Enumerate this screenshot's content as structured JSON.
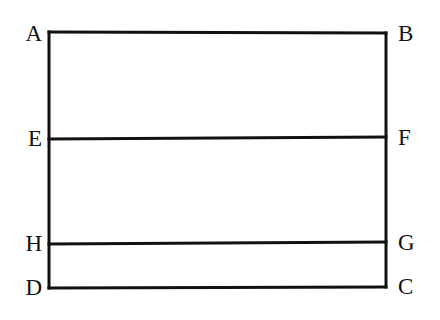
{
  "figure": {
    "background_color": "#ffffff",
    "stroke_color": "#111111",
    "stroke_width": 3,
    "canvas": {
      "width": 440,
      "height": 320
    },
    "labels": {
      "a": "A",
      "b": "B",
      "c": "C",
      "d": "D",
      "e": "E",
      "f": "F",
      "g": "G",
      "h": "H"
    },
    "points": {
      "A": {
        "x": 49,
        "y": 32
      },
      "B": {
        "x": 386,
        "y": 33
      },
      "C": {
        "x": 386,
        "y": 287
      },
      "D": {
        "x": 49,
        "y": 288
      },
      "E": {
        "x": 49,
        "y": 139
      },
      "F": {
        "x": 386,
        "y": 137
      },
      "G": {
        "x": 386,
        "y": 242
      },
      "H": {
        "x": 49,
        "y": 244
      }
    },
    "segments": [
      {
        "name": "AB",
        "from": "A",
        "to": "B"
      },
      {
        "name": "BC",
        "from": "B",
        "to": "C"
      },
      {
        "name": "CD",
        "from": "C",
        "to": "D"
      },
      {
        "name": "DA",
        "from": "D",
        "to": "A"
      },
      {
        "name": "EF",
        "from": "E",
        "to": "F"
      },
      {
        "name": "HG",
        "from": "H",
        "to": "G"
      }
    ]
  }
}
